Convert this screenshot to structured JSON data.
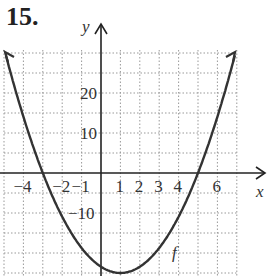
{
  "problem_number": "15.",
  "chart_data": {
    "type": "line",
    "title": "",
    "xlabel": "x",
    "ylabel": "y",
    "curve_label": "f",
    "x_tick_labels": [
      "-4",
      "-2",
      "-1",
      "1",
      "2",
      "3",
      "4",
      "6"
    ],
    "y_tick_labels": [
      "20",
      "10",
      "-10"
    ],
    "xlim": [
      -5,
      7
    ],
    "ylim": [
      -25,
      30
    ],
    "grid": true,
    "grid_style": "dotted",
    "x": [
      -5,
      -4,
      -3,
      -2,
      -1,
      0,
      1,
      2,
      3,
      4,
      5,
      6,
      7
    ],
    "values": [
      30,
      17,
      0,
      -11,
      -19,
      -23,
      -25,
      -23,
      -19,
      -11,
      0,
      17,
      30
    ]
  }
}
